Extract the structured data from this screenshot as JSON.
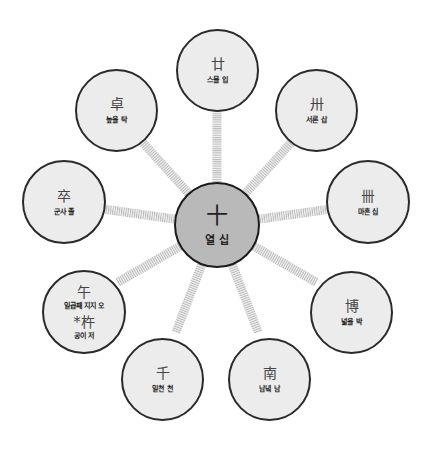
{
  "diagram": {
    "center": {
      "hanja": "十",
      "reading": "열 십"
    },
    "nodes": [
      {
        "id": "twenty",
        "hanja": "廿",
        "reading": "스물 입"
      },
      {
        "id": "thirty",
        "hanja": "卅",
        "reading": "서른 삽"
      },
      {
        "id": "forty",
        "hanja": "卌",
        "reading": "마흔 십"
      },
      {
        "id": "broad",
        "hanja": "博",
        "reading": "넓을 박"
      },
      {
        "id": "south",
        "hanja": "南",
        "reading": "남녘 남"
      },
      {
        "id": "thousand",
        "hanja": "千",
        "reading": "일천 천"
      },
      {
        "id": "noon",
        "hanja": "午",
        "reading": "일곱째 지지 오",
        "hanja2": "*杵",
        "reading2": "공이 저"
      },
      {
        "id": "soldier",
        "hanja": "卒",
        "reading": "군사 졸"
      },
      {
        "id": "high",
        "hanja": "卓",
        "reading": "높을 탁"
      }
    ]
  },
  "colors": {
    "center_fill": "#b9b9b9",
    "node_fill": "#ececec",
    "outline": "#2a2a2a",
    "spoke": "#bdbdbd"
  }
}
